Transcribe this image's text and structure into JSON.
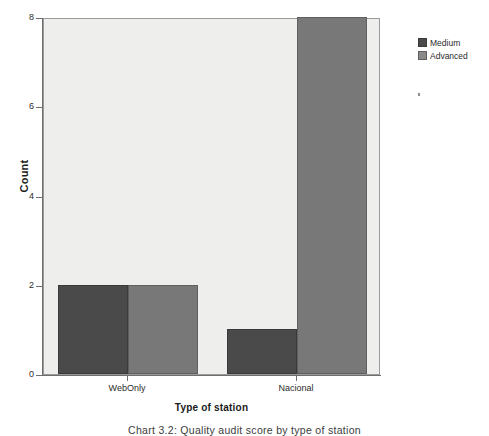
{
  "chart_data": {
    "type": "bar",
    "title": "",
    "xlabel": "Type of station",
    "ylabel": "Count",
    "categories": [
      "WebOnly",
      "Nacional"
    ],
    "series": [
      {
        "name": "Medium",
        "values": [
          2,
          1
        ],
        "color": "#4a4a4a"
      },
      {
        "name": "Advanced",
        "values": [
          2,
          8
        ],
        "color": "#787878"
      }
    ],
    "ylim": [
      0,
      8
    ],
    "yticks": [
      0,
      2,
      4,
      6,
      8
    ],
    "ytick_labels": [
      "0",
      "2",
      "4",
      "6",
      "8"
    ],
    "grid": false,
    "legend_position": "top-right",
    "plot_background": "#eeeeec",
    "bar_grouping": "clustered"
  },
  "axes": {
    "y_title": "Count",
    "x_title": "Type of station",
    "y_ticks": [
      {
        "label": "8",
        "value": 8
      },
      {
        "label": "6",
        "value": 6
      },
      {
        "label": "4",
        "value": 4
      },
      {
        "label": "2",
        "value": 2
      },
      {
        "label": "0",
        "value": 0
      }
    ],
    "x_ticks": [
      {
        "label": "WebOnly"
      },
      {
        "label": "Nacional"
      }
    ]
  },
  "legend": {
    "items": [
      {
        "label": "Medium",
        "color": "#4a4a4a"
      },
      {
        "label": "Advanced",
        "color": "#8a8a8a"
      }
    ]
  },
  "caption": {
    "text": "Chart 3.2: Quality audit score by type of station"
  }
}
